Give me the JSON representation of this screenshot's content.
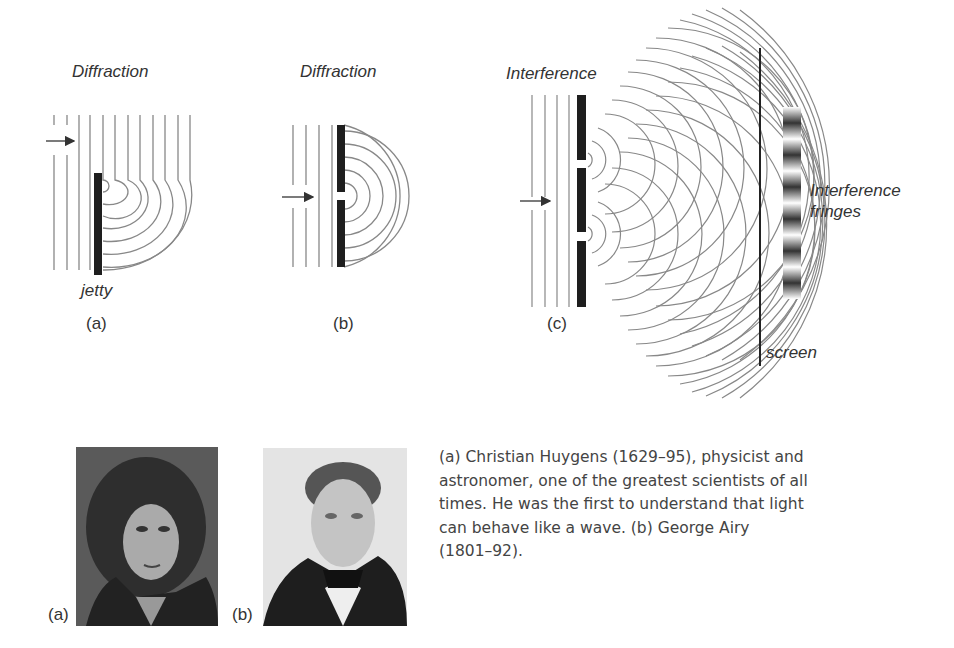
{
  "figure": {
    "panels": [
      {
        "id": "a",
        "title": "Diffraction",
        "panel_label": "(a)",
        "annotation": "jetty"
      },
      {
        "id": "b",
        "title": "Diffraction",
        "panel_label": "(b)"
      },
      {
        "id": "c",
        "title": "Interference",
        "panel_label": "(c)",
        "fringes_label_line1": "Interference",
        "fringes_label_line2": "fringes",
        "screen_label": "screen"
      }
    ]
  },
  "portraits": [
    {
      "label": "(a)",
      "subject": "Christian Huygens portrait"
    },
    {
      "label": "(b)",
      "subject": "George Airy portrait"
    }
  ],
  "caption": {
    "text": "(a) Christian Huygens (1629–95), physicist and\nastronomer, one of the greatest scientists of all\ntimes. He was the first to understand that light\ncan behave like a wave. (b) George Airy\n(1801–92)."
  },
  "colors": {
    "line": "#888888",
    "barrier": "#1e1e1e",
    "text": "#333333"
  }
}
